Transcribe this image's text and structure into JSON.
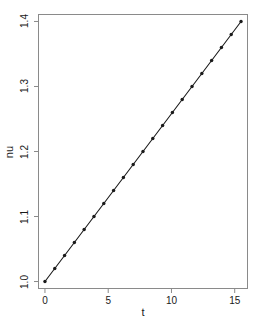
{
  "chart_data": {
    "type": "line",
    "title": "",
    "subtitle": "",
    "xlabel": "t",
    "ylabel": "nu",
    "xlim": [
      -0.55,
      16.05
    ],
    "ylim": [
      0.9885,
      1.4115
    ],
    "xticks": [
      0,
      5,
      10,
      15
    ],
    "xtick_labels": [
      "0",
      "5",
      "10",
      "15"
    ],
    "yticks": [
      1.0,
      1.1,
      1.2,
      1.3,
      1.4
    ],
    "ytick_labels": [
      "1.0",
      "1.1",
      "1.2",
      "1.3",
      "1.4"
    ],
    "grid": false,
    "legend": null,
    "annotations": [],
    "line_color": "#1a1a1a",
    "marker": "filled-circle",
    "marker_color": "#1a1a1a",
    "box": true,
    "series": [
      {
        "name": "nu",
        "x": [
          0.0,
          0.775,
          1.55,
          2.325,
          3.1,
          3.875,
          4.65,
          5.425,
          6.2,
          6.975,
          7.75,
          8.525,
          9.3,
          10.075,
          10.85,
          11.625,
          12.4,
          13.175,
          13.95,
          14.725,
          15.5
        ],
        "values": [
          1.0,
          1.02,
          1.04,
          1.06,
          1.08,
          1.1,
          1.12,
          1.14,
          1.16,
          1.18,
          1.2,
          1.22,
          1.24,
          1.26,
          1.28,
          1.3,
          1.32,
          1.34,
          1.36,
          1.38,
          1.4
        ]
      }
    ]
  },
  "figure": {
    "background_color": "#ffffff",
    "box_color": "#8a8a8a",
    "axis_text_color": "#1a1a1a"
  }
}
